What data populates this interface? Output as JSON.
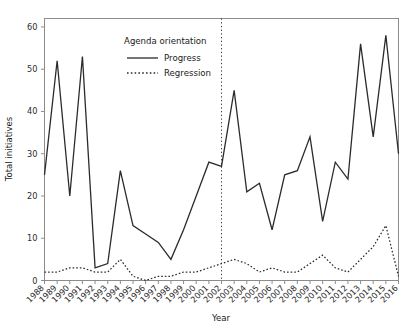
{
  "chart_data": {
    "type": "line",
    "title": "",
    "xlabel": "Year",
    "ylabel": "Total initiatives",
    "xlim": [
      1988,
      2016
    ],
    "ylim": [
      0,
      62
    ],
    "yticks": [
      0,
      10,
      20,
      30,
      40,
      50,
      60
    ],
    "grid": false,
    "legend_position": "upper-center-left",
    "legend_title": "Agenda orientation",
    "categories": [
      "1988",
      "1989",
      "1990",
      "1991",
      "1992",
      "1993",
      "1994",
      "1995",
      "1996",
      "1997",
      "1998",
      "1999",
      "2000",
      "2001",
      "2002",
      "2003",
      "2004",
      "2005",
      "2006",
      "2007",
      "2008",
      "2009",
      "2010",
      "2011",
      "2012",
      "2013",
      "2014",
      "2015",
      "2016"
    ],
    "series": [
      {
        "name": "Progress",
        "style": "solid",
        "color": "#2b2b2b",
        "values": [
          25,
          52,
          20,
          53,
          3,
          4,
          26,
          13,
          11,
          9,
          5,
          12,
          20,
          28,
          27,
          45,
          21,
          23,
          12,
          25,
          26,
          34,
          14,
          28,
          24,
          56,
          34,
          58,
          30
        ]
      },
      {
        "name": "Regression",
        "style": "dotted",
        "color": "#2b2b2b",
        "values": [
          2,
          2,
          3,
          3,
          2,
          2,
          5,
          1,
          0,
          1,
          1,
          2,
          2,
          3,
          4,
          5,
          4,
          2,
          3,
          2,
          2,
          4,
          6,
          3,
          2,
          5,
          8,
          13,
          1
        ]
      }
    ],
    "annotations": [
      {
        "type": "vertical-line",
        "style": "dotted",
        "x": "2002",
        "label": ""
      }
    ]
  },
  "axes": {
    "x_title": "Year",
    "y_title": "Total initiatives"
  },
  "legend": {
    "title": "Agenda orientation",
    "entries": [
      {
        "label": "Progress",
        "style": "solid"
      },
      {
        "label": "Regression",
        "style": "dotted"
      }
    ]
  }
}
